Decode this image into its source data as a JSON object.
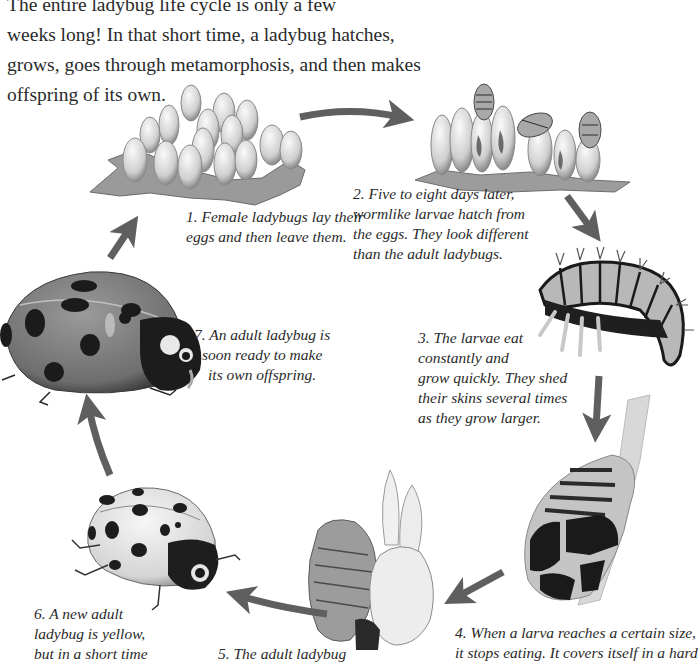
{
  "intro": {
    "lines": [
      "The entire ladybug life cycle is only a few",
      "weeks long! In that short time, a ladybug hatches,",
      "grows, goes through metamorphosis, and then makes",
      "offspring of its own."
    ]
  },
  "stages": [
    {
      "id": 1,
      "illustration": "ladybug-eggs-on-leaf",
      "caption_lines": [
        "1. Female ladybugs lay their",
        "eggs and then leave them."
      ]
    },
    {
      "id": 2,
      "illustration": "larvae-hatching-from-eggs",
      "caption_lines": [
        "2. Five to eight days later,",
        "wormlike larvae hatch from",
        "the eggs. They look different",
        "than the adult ladybugs."
      ]
    },
    {
      "id": 3,
      "illustration": "spiky-larva",
      "caption_lines": [
        "3. The larvae eat",
        "constantly and",
        "grow quickly. They shed",
        "their skins several times",
        "as they grow larger."
      ]
    },
    {
      "id": 4,
      "illustration": "pupa-on-stem",
      "caption_lines": [
        "4. When a larva reaches a certain size,",
        "it stops eating. It covers itself in a hard"
      ]
    },
    {
      "id": 5,
      "illustration": "adult-emerging-from-pupa",
      "caption_lines": [
        "5. The adult ladybug"
      ]
    },
    {
      "id": 6,
      "illustration": "yellow-spotted-ladybug",
      "caption_lines": [
        "6. A new adult",
        "ladybug is yellow,",
        "but in a short time"
      ]
    },
    {
      "id": 7,
      "illustration": "red-spotted-adult-ladybug",
      "caption_lines": [
        "7. An adult ladybug is",
        "soon ready to make",
        "its own offspring."
      ]
    }
  ],
  "colors": {
    "arrow": "#5f5f5f",
    "text": "#2a2a2a",
    "ladybug_red": "#7a7a7a",
    "spots": "#1a1a1a"
  }
}
